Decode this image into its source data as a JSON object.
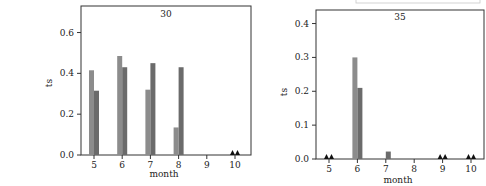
{
  "chart_data": [
    {
      "type": "bar",
      "title": "30",
      "xlabel": "month",
      "ylabel": "ts",
      "categories": [
        "5",
        "6",
        "7",
        "8",
        "9",
        "10"
      ],
      "ylim": [
        0,
        0.73
      ],
      "yticks": [
        "0.0",
        "0.2",
        "0.4",
        "0.6"
      ],
      "ytick_values": [
        0,
        0.2,
        0.4,
        0.6
      ],
      "series": [
        {
          "name": "series-1",
          "color": "#8c8c8c",
          "values": [
            0.415,
            0.485,
            0.32,
            0.135,
            0,
            0
          ]
        },
        {
          "name": "series-2",
          "color": "#6b6b6b",
          "values": [
            0.315,
            0.43,
            0.45,
            0.43,
            0,
            0
          ]
        }
      ],
      "zero_markers": [
        "10"
      ],
      "grid": false
    },
    {
      "type": "bar",
      "title": "35",
      "xlabel": "month",
      "ylabel": "ts",
      "categories": [
        "5",
        "6",
        "7",
        "8",
        "9",
        "10"
      ],
      "ylim": [
        0,
        0.44
      ],
      "yticks": [
        "0.0",
        "0.1",
        "0.2",
        "0.3",
        "0.4"
      ],
      "ytick_values": [
        0,
        0.1,
        0.2,
        0.3,
        0.4
      ],
      "series": [
        {
          "name": "series-1",
          "color": "#8c8c8c",
          "values": [
            0,
            0.3,
            0,
            0,
            0,
            0
          ]
        },
        {
          "name": "series-2",
          "color": "#6b6b6b",
          "values": [
            0,
            0.21,
            0.022,
            0,
            0,
            0
          ]
        }
      ],
      "zero_markers": [
        "5",
        "9",
        "10"
      ],
      "grid": false
    }
  ]
}
